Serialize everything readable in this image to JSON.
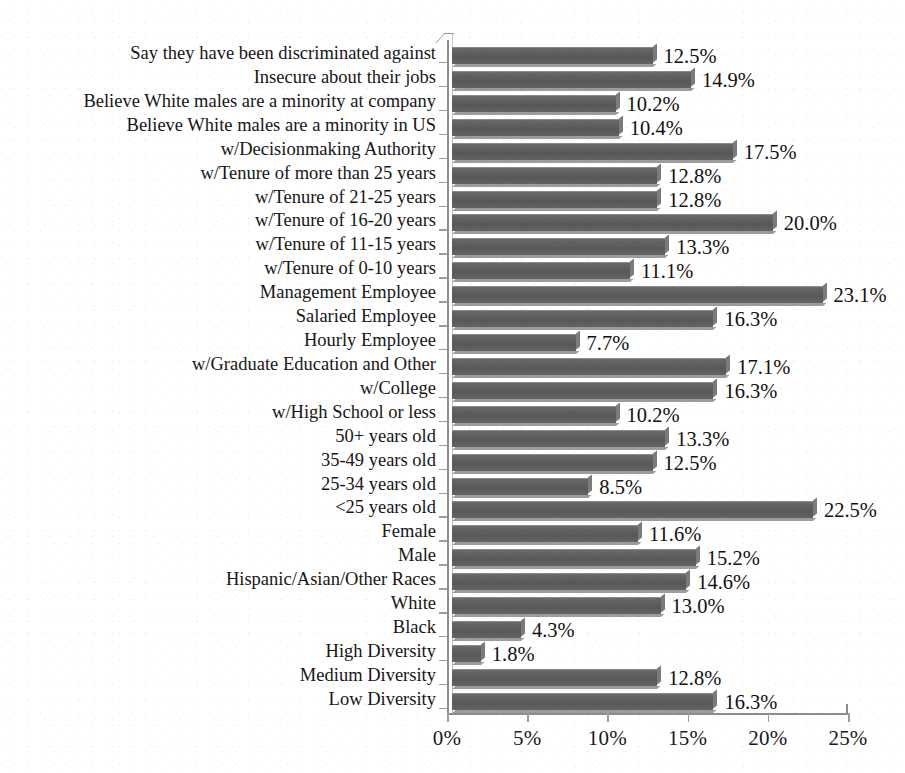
{
  "chart_data": {
    "type": "bar",
    "orientation": "horizontal",
    "title": "",
    "xlabel": "",
    "ylabel": "",
    "xlim": [
      0,
      25
    ],
    "grid": false,
    "legend": null,
    "value_suffix": "%",
    "xtick_labels": [
      "0%",
      "5%",
      "10%",
      "15%",
      "20%",
      "25%"
    ],
    "xtick_values": [
      0,
      5,
      10,
      15,
      20,
      25
    ],
    "bar_color": "#5e5e5e",
    "categories": [
      "Say they have been discriminated against",
      "Insecure about their jobs",
      "Believe White males are a minority at company",
      "Believe White males are a minority in US",
      "w/Decisionmaking Authority",
      "w/Tenure of more than 25 years",
      "w/Tenure of 21-25 years",
      "w/Tenure of 16-20 years",
      "w/Tenure of 11-15 years",
      "w/Tenure of 0-10 years",
      "Management Employee",
      "Salaried Employee",
      "Hourly Employee",
      "w/Graduate Education and Other",
      "w/College",
      "w/High School or less",
      "50+ years old",
      "35-49 years old",
      "25-34 years old",
      "<25 years old",
      "Female",
      "Male",
      "Hispanic/Asian/Other Races",
      "White",
      "Black",
      "High Diversity",
      "Medium Diversity",
      "Low Diversity"
    ],
    "values": [
      12.5,
      14.9,
      10.2,
      10.4,
      17.5,
      12.8,
      12.8,
      20.0,
      13.3,
      11.1,
      23.1,
      16.3,
      7.7,
      17.1,
      16.3,
      10.2,
      13.3,
      12.5,
      8.5,
      22.5,
      11.6,
      15.2,
      14.6,
      13.0,
      4.3,
      1.8,
      12.8,
      16.3
    ],
    "data_labels": [
      "12.5%",
      "14.9%",
      "10.2%",
      "10.4%",
      "17.5%",
      "12.8%",
      "12.8%",
      "20.0%",
      "13.3%",
      "11.1%",
      "23.1%",
      "16.3%",
      "7.7%",
      "17.1%",
      "16.3%",
      "10.2%",
      "13.3%",
      "12.5%",
      "8.5%",
      "22.5%",
      "11.6%",
      "15.2%",
      "14.6%",
      "13.0%",
      "4.3%",
      "1.8%",
      "12.8%",
      "16.3%"
    ]
  }
}
